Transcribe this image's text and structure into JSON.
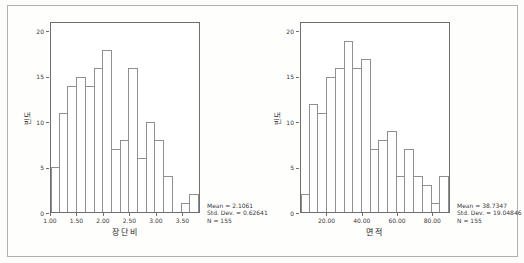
{
  "figure": {
    "background": "#fdfdfc",
    "frame_color": "#b0b0af",
    "axis_color": "#6e6e6e",
    "bar_border_color": "#8f8f8f",
    "bar_fill_color": "#ffffff",
    "text_color": "#3a3a3a"
  },
  "chart_data": [
    {
      "type": "bar",
      "subtype": "histogram",
      "title": "",
      "xlabel": "장단비",
      "ylabel": "빈도",
      "bin_start": 1.0,
      "bin_width": 0.166667,
      "bin_count": 17,
      "values": [
        5,
        11,
        14,
        15,
        14,
        16,
        18,
        7,
        8,
        16,
        6,
        10,
        8,
        4,
        0,
        1,
        2
      ],
      "x_ticks": [
        {
          "value": 1.0,
          "label": "1.00"
        },
        {
          "value": 1.5,
          "label": "1.50"
        },
        {
          "value": 2.0,
          "label": "2.00"
        },
        {
          "value": 2.5,
          "label": "2.50"
        },
        {
          "value": 3.0,
          "label": "3.00"
        },
        {
          "value": 3.5,
          "label": "3.50"
        }
      ],
      "y_ticks": [
        {
          "value": 0,
          "label": "0"
        },
        {
          "value": 5,
          "label": "5"
        },
        {
          "value": 10,
          "label": "10"
        },
        {
          "value": 15,
          "label": "15"
        },
        {
          "value": 20,
          "label": "20"
        }
      ],
      "ylim": [
        0,
        21
      ],
      "grid": false,
      "legend": "none",
      "annotations": [
        "Mean = 2.1061",
        "Std. Dev. = 0.62641",
        "N = 155"
      ]
    },
    {
      "type": "bar",
      "subtype": "histogram",
      "title": "",
      "xlabel": "면적",
      "ylabel": "빈도",
      "bin_start": 5,
      "bin_width": 5,
      "bin_count": 17,
      "values": [
        2,
        12,
        11,
        15,
        16,
        19,
        16,
        17,
        7,
        8,
        9,
        4,
        7,
        4,
        3,
        1,
        4
      ],
      "x_ticks": [
        {
          "value": 20,
          "label": "20.00"
        },
        {
          "value": 40,
          "label": "40.00"
        },
        {
          "value": 60,
          "label": "60.00"
        },
        {
          "value": 80,
          "label": "80.00"
        }
      ],
      "y_ticks": [
        {
          "value": 0,
          "label": "0"
        },
        {
          "value": 5,
          "label": "5"
        },
        {
          "value": 10,
          "label": "10"
        },
        {
          "value": 15,
          "label": "15"
        },
        {
          "value": 20,
          "label": "20"
        }
      ],
      "ylim": [
        0,
        21
      ],
      "grid": false,
      "legend": "none",
      "annotations": [
        "Mean = 38.7347",
        "Std. Dev. = 19.04846",
        "N = 155"
      ]
    }
  ]
}
